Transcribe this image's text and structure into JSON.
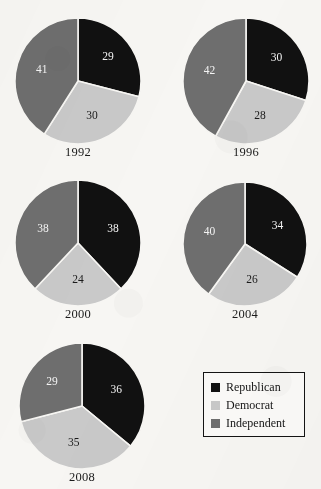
{
  "chart_data": {
    "type": "pie",
    "title": "",
    "legend_position": "bottom-right",
    "categories": [
      "Republican",
      "Democrat",
      "Independent"
    ],
    "colors": {
      "Republican": "#111111",
      "Democrat": "#c9c9c9",
      "Independent": "#6e6e6e"
    },
    "label_text_color_on_dark": "#f4f4f4",
    "label_text_color_on_light": "#1a1a1a",
    "background": "#f7f6f3",
    "units": "percent",
    "start_angle_deg": 0,
    "direction": "clockwise",
    "charts": [
      {
        "id": "pie-1992",
        "year": "1992",
        "slices": [
          {
            "name": "Republican",
            "value": 29,
            "label": "29"
          },
          {
            "name": "Democrat",
            "value": 30,
            "label": "30"
          },
          {
            "name": "Independent",
            "value": 41,
            "label": "41"
          }
        ]
      },
      {
        "id": "pie-1996",
        "year": "1996",
        "slices": [
          {
            "name": "Republican",
            "value": 30,
            "label": "30"
          },
          {
            "name": "Democrat",
            "value": 28,
            "label": "28"
          },
          {
            "name": "Independent",
            "value": 42,
            "label": "42"
          }
        ]
      },
      {
        "id": "pie-2000",
        "year": "2000",
        "slices": [
          {
            "name": "Republican",
            "value": 38,
            "label": "38"
          },
          {
            "name": "Democrat",
            "value": 24,
            "label": "24"
          },
          {
            "name": "Independent",
            "value": 38,
            "label": "38"
          }
        ]
      },
      {
        "id": "pie-2004",
        "year": "2004",
        "slices": [
          {
            "name": "Republican",
            "value": 34,
            "label": "34"
          },
          {
            "name": "Democrat",
            "value": 26,
            "label": "26"
          },
          {
            "name": "Independent",
            "value": 40,
            "label": "40"
          }
        ]
      },
      {
        "id": "pie-2008",
        "year": "2008",
        "slices": [
          {
            "name": "Republican",
            "value": 36,
            "label": "36"
          },
          {
            "name": "Democrat",
            "value": 35,
            "label": "35"
          },
          {
            "name": "Independent",
            "value": 29,
            "label": "29"
          }
        ]
      }
    ]
  },
  "legend": {
    "entries": [
      {
        "label": "Republican",
        "color": "#111111",
        "swatch_name": "legend-swatch-republican"
      },
      {
        "label": "Democrat",
        "color": "#c9c9c9",
        "swatch_name": "legend-swatch-democrat"
      },
      {
        "label": "Independent",
        "color": "#6e6e6e",
        "swatch_name": "legend-swatch-independent"
      }
    ]
  },
  "layout": {
    "panels": [
      {
        "chart": 0,
        "left": 15,
        "top": 18,
        "size": 126,
        "caption_top": 145
      },
      {
        "chart": 1,
        "left": 183,
        "top": 18,
        "size": 126,
        "caption_top": 145
      },
      {
        "chart": 2,
        "left": 15,
        "top": 180,
        "size": 126,
        "caption_top": 307
      },
      {
        "chart": 3,
        "left": 183,
        "top": 182,
        "size": 124,
        "caption_top": 307
      },
      {
        "chart": 4,
        "left": 19,
        "top": 343,
        "size": 126,
        "caption_top": 470
      }
    ]
  }
}
